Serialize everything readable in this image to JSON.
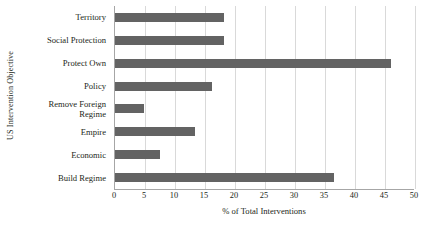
{
  "chart_data": {
    "type": "bar",
    "orientation": "horizontal",
    "title": "",
    "xlabel": "% of Total Interventions",
    "ylabel": "US Intervention Objective",
    "categories": [
      "Territory",
      "Social Protection",
      "Protect Own",
      "Policy",
      "Remove Foreign Regime",
      "Empire",
      "Economic",
      "Build Regime"
    ],
    "category_lines": [
      [
        "Territory"
      ],
      [
        "Social Protection"
      ],
      [
        "Protect Own"
      ],
      [
        "Policy"
      ],
      [
        "Remove Foreign",
        "Regime"
      ],
      [
        "Empire"
      ],
      [
        "Economic"
      ],
      [
        "Build Regime"
      ]
    ],
    "values": [
      18.2,
      18.2,
      46.0,
      16.2,
      4.8,
      13.3,
      7.5,
      36.5
    ],
    "xlim": [
      0,
      50
    ],
    "xticks": [
      0,
      5,
      10,
      15,
      20,
      25,
      30,
      35,
      40,
      45,
      50
    ],
    "xtick_labels": [
      "0",
      "5",
      "10",
      "15",
      "20",
      "25",
      "30",
      "35",
      "40",
      "45",
      "50"
    ],
    "grid": "vertical",
    "legend": "none",
    "bar_color": "#636363",
    "gridline_color": "#d9d9d9",
    "axis_color": "#a6a6a6",
    "background_color": "#ffffff",
    "text_color": "#231f20"
  }
}
